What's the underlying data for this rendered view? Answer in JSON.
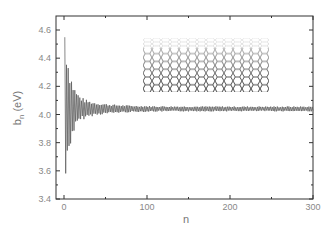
{
  "chart_data": {
    "type": "line",
    "title": "",
    "xlabel": "n",
    "ylabel": "b_n (eV)",
    "ylabel_main": "b",
    "ylabel_sub": "n",
    "ylabel_unit": " (eV)",
    "xlim": [
      0,
      300
    ],
    "ylim": [
      3.4,
      4.7
    ],
    "xticks": [
      0,
      100,
      200,
      300
    ],
    "xtick_labels": [
      "0",
      "100",
      "200",
      "300"
    ],
    "yticks": [
      3.4,
      3.6,
      3.8,
      4.0,
      4.2,
      4.4,
      4.6
    ],
    "ytick_labels": [
      "3.4",
      "3.6",
      "3.8",
      "4.0",
      "4.2",
      "4.4",
      "4.6"
    ],
    "grid": false,
    "legend": null,
    "series": [
      {
        "name": "b_n",
        "description": "Damped oscillation converging to ~4.04 eV; large amplitude (3.45–4.68) for n<10, decaying to ~±0.02 by n≈100 and flat through n=300",
        "converged_value": 4.04,
        "x": [
          1,
          2,
          3,
          4,
          5,
          6,
          7,
          8,
          9,
          10,
          12,
          14,
          16,
          18,
          20,
          25,
          30,
          35,
          40,
          50,
          60,
          70,
          80,
          100,
          150,
          200,
          250,
          300
        ],
        "y": [
          4.68,
          3.55,
          4.62,
          3.47,
          4.55,
          3.62,
          4.38,
          3.75,
          4.25,
          3.85,
          4.18,
          3.92,
          4.14,
          3.95,
          4.12,
          3.97,
          4.09,
          3.99,
          4.08,
          4.01,
          4.06,
          4.02,
          4.05,
          4.04,
          4.04,
          4.04,
          4.04,
          4.04
        ]
      }
    ],
    "inset": {
      "description": "graphene honeycomb lattice sheet in perspective",
      "name": "graphene-lattice-image"
    }
  }
}
